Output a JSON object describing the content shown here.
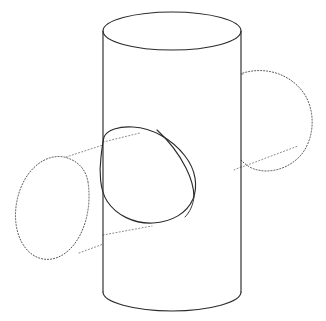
{
  "figure": {
    "caption": "",
    "background_color": "#ffffff",
    "solid_line_color": "#2b2b2b",
    "hidden_line_color": "#4a4a4a",
    "hidden_line_style": "dotted",
    "width": 326,
    "height": 321
  },
  "parts": {
    "vertical_cylinder": {
      "name": "vertical cylinder",
      "visibility": "solid",
      "top_ellipse": {
        "center_x": 172,
        "center_y": 31,
        "radius_x": 69,
        "radius_y": 19
      },
      "bottom_ellipse": {
        "center_x": 172,
        "center_y": 292,
        "radius_x": 69,
        "radius_y": 19
      },
      "left_edge_x": 103,
      "right_edge_x": 241,
      "top_y": 12,
      "bottom_y": 311
    },
    "horizontal_cylinder": {
      "name": "horizontal cylinder",
      "visibility": "dotted",
      "axis_tilt": "rising to the right",
      "left_cap_ellipse": {
        "center_x": 52,
        "center_y": 200,
        "radius_x": 38,
        "radius_y": 48
      },
      "right_cap_ellipse": {
        "center_x": 272,
        "center_y": 119,
        "radius_x": 41,
        "radius_y": 50
      }
    },
    "intersection_opening": {
      "name": "intersection hole opening",
      "visibility": "solid",
      "leftmost_x": 104,
      "rightmost_x": 196,
      "top_y": 126,
      "bottom_y": 223,
      "inner_seam": "visible arc inside the opening"
    }
  },
  "labels": {
    "annotations": []
  }
}
